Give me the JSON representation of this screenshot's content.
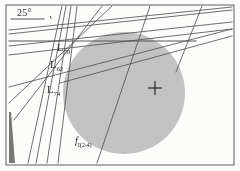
{
  "figure": {
    "background_color": "#fdfdfc",
    "frame": {
      "color": "#6d6d6d",
      "x": 6,
      "y": 5,
      "width": 228,
      "height": 160,
      "stroke_width": 1.1
    },
    "circle": {
      "label": "shaded-circular-region",
      "fill_color": "#c3c3c3",
      "cx": 124,
      "cy": 93,
      "r": 61
    },
    "center_marker": {
      "label": "cross-marker",
      "symbol": "+",
      "color": "#333333",
      "x": 155,
      "y": 88,
      "arm_length": 7
    },
    "wedge": {
      "label": "dark-wedge-artifact",
      "color": "#4a4a4a",
      "points": "9,112 9,163 15,163 11,112"
    },
    "line_color": "#555555",
    "line_width": 0.85,
    "lines": [
      {
        "name": "angle-reference-line",
        "x1": 11,
        "y1": 19,
        "x2": 44,
        "y2": 19,
        "width": 1.0
      },
      {
        "name": "line-L70-horizontal",
        "x1": 9,
        "y1": 41,
        "x2": 196,
        "y2": 41,
        "width": 1.0
      },
      {
        "name": "line-pencil-1",
        "x1": 9,
        "y1": 30,
        "x2": 232,
        "y2": 7
      },
      {
        "name": "line-pencil-2",
        "x1": 9,
        "y1": 34,
        "x2": 232,
        "y2": 10
      },
      {
        "name": "line-pencil-3",
        "x1": 9,
        "y1": 46,
        "x2": 232,
        "y2": 22
      },
      {
        "name": "line-pencil-4",
        "x1": 9,
        "y1": 55,
        "x2": 232,
        "y2": 29
      },
      {
        "name": "line-L62-secant",
        "x1": 9,
        "y1": 87,
        "x2": 232,
        "y2": 29
      },
      {
        "name": "line-steep-1",
        "x1": 28,
        "y1": 163,
        "x2": 62,
        "y2": 6
      },
      {
        "name": "line-steep-2",
        "x1": 36,
        "y1": 163,
        "x2": 66,
        "y2": 6
      },
      {
        "name": "line-steep-3",
        "x1": 47,
        "y1": 163,
        "x2": 71,
        "y2": 6
      },
      {
        "name": "line-steep-4",
        "x1": 58,
        "y1": 163,
        "x2": 77,
        "y2": 6
      },
      {
        "name": "line-diagonal-long-1",
        "x1": 14,
        "y1": 120,
        "x2": 102,
        "y2": 6
      },
      {
        "name": "line-fI24",
        "x1": 97,
        "y1": 163,
        "x2": 150,
        "y2": 6
      },
      {
        "name": "line-right-steep",
        "x1": 176,
        "y1": 72,
        "x2": 202,
        "y2": 6
      },
      {
        "name": "line-L74-diagonal",
        "x1": 9,
        "y1": 103,
        "x2": 112,
        "y2": 6
      },
      {
        "name": "line-shallow-right",
        "x1": 60,
        "y1": 83,
        "x2": 232,
        "y2": 36
      }
    ],
    "angle_arc": {
      "name": "angle-arc-25deg",
      "cx": 44,
      "cy": 19,
      "r": 7,
      "color": "#555555"
    },
    "labels": [
      {
        "name": "label-angle-25",
        "text": "25",
        "sub": "",
        "suffix": "°",
        "x": 17,
        "y": 8,
        "style": "angle"
      },
      {
        "name": "label-L70",
        "text": "L",
        "sub": "70",
        "suffix": "",
        "x": 57,
        "y": 43,
        "style": "main"
      },
      {
        "name": "label-L62",
        "text": "L",
        "sub": "62",
        "suffix": "",
        "x": 50,
        "y": 60,
        "style": "main"
      },
      {
        "name": "label-L74",
        "text": "L",
        "sub": "74",
        "suffix": "",
        "x": 47,
        "y": 85,
        "style": "main"
      },
      {
        "name": "label-f-I-2-4",
        "text": "f",
        "sub": "I(2-4)",
        "suffix": "",
        "x": 75,
        "y": 136,
        "style": "f"
      }
    ]
  }
}
